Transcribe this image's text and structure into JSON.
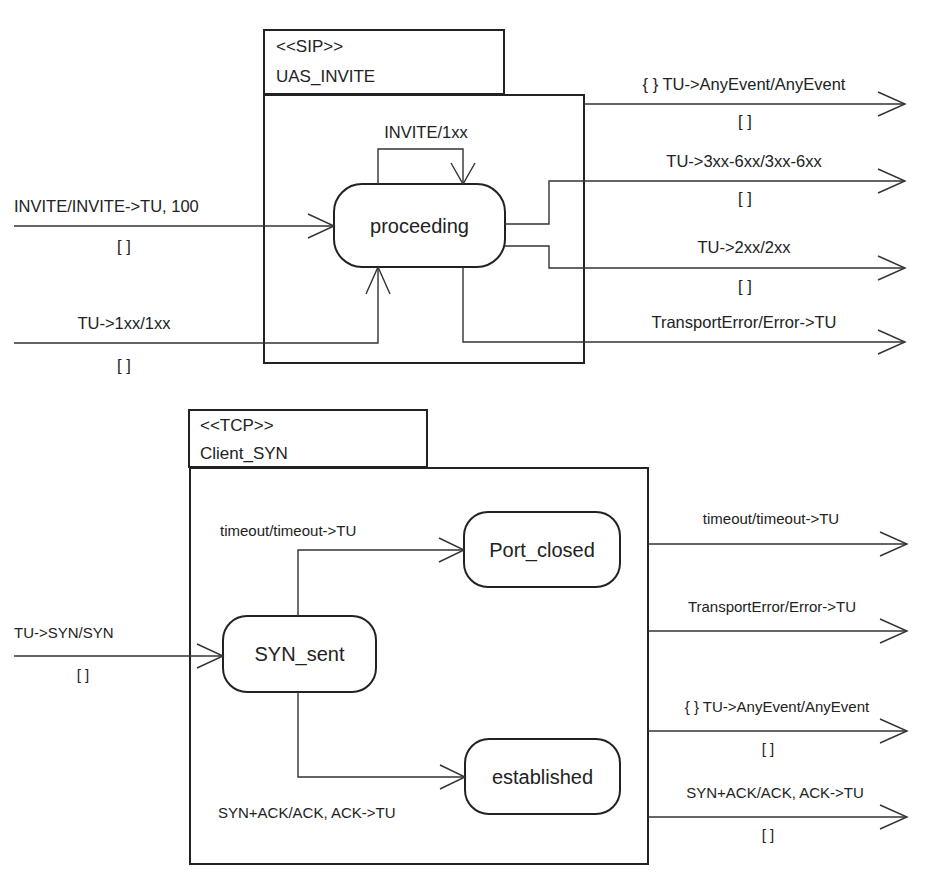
{
  "colors": {
    "line": "#333333",
    "text": "#222222",
    "background": "#ffffff"
  },
  "sip_component": {
    "stereotype": "<<SIP>>",
    "name": "UAS_INVITE",
    "states": [
      {
        "id": "proceeding",
        "label": "proceeding"
      }
    ],
    "internal_transitions": [
      {
        "from": "proceeding",
        "to": "proceeding",
        "label": "INVITE/1xx"
      }
    ],
    "incoming": [
      {
        "label": "INVITE/INVITE->TU, 100",
        "guard": "[ ]",
        "target": "proceeding"
      },
      {
        "label": "TU->1xx/1xx",
        "guard": "[ ]",
        "target": "proceeding"
      }
    ],
    "outgoing": [
      {
        "label": "{ } TU->AnyEvent/AnyEvent",
        "guard": "[ ]"
      },
      {
        "label": "TU->3xx-6xx/3xx-6xx",
        "guard": "[ ]"
      },
      {
        "label": "TU->2xx/2xx",
        "guard": "[ ]"
      },
      {
        "label": "TransportError/Error->TU",
        "guard": ""
      }
    ]
  },
  "tcp_component": {
    "stereotype": "<<TCP>>",
    "name": "Client_SYN",
    "states": [
      {
        "id": "syn_sent",
        "label": "SYN_sent"
      },
      {
        "id": "port_closed",
        "label": "Port_closed"
      },
      {
        "id": "established",
        "label": "established"
      }
    ],
    "internal_transitions": [
      {
        "from": "SYN_sent",
        "to": "Port_closed",
        "label": "timeout/timeout->TU"
      },
      {
        "from": "SYN_sent",
        "to": "established",
        "label": "SYN+ACK/ACK, ACK->TU"
      }
    ],
    "incoming": [
      {
        "label": "TU->SYN/SYN",
        "guard": "[ ]",
        "target": "SYN_sent"
      }
    ],
    "outgoing": [
      {
        "label": "timeout/timeout->TU",
        "guard": ""
      },
      {
        "label": "TransportError/Error->TU",
        "guard": ""
      },
      {
        "label": "{ } TU->AnyEvent/AnyEvent",
        "guard": "[ ]"
      },
      {
        "label": "SYN+ACK/ACK, ACK->TU",
        "guard": "[ ]"
      }
    ]
  }
}
